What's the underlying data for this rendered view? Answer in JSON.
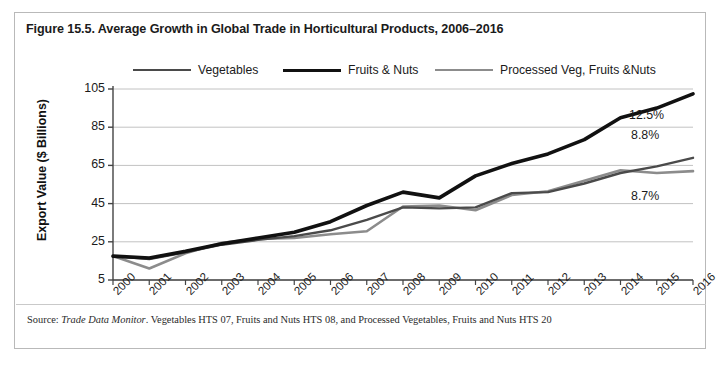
{
  "figure": {
    "title": "Figure 15.5. Average Growth in Global Trade in Horticultural Products, 2006–2016",
    "source_prefix": "Source:",
    "source_italic": "Trade Data Monitor",
    "source_rest": ". Vegetables HTS 07, Fruits and Nuts HTS 08, and Processed Vegetables, Fruits and Nuts HTS 20",
    "border_color": "#b9b9b9"
  },
  "legend": {
    "position": "top",
    "items": [
      {
        "label": "Vegetables",
        "color": "#4a4a4a",
        "width": 2.4
      },
      {
        "label": "Fruits & Nuts",
        "color": "#111111",
        "width": 3.6
      },
      {
        "label": "Processed Veg, Fruits &Nuts",
        "color": "#8c8c8c",
        "width": 2.6
      }
    ]
  },
  "annotations": [
    {
      "text": "12.5%",
      "series": "Fruits & Nuts"
    },
    {
      "text": "8.8%",
      "series": "Vegetables"
    },
    {
      "text": "8.7%",
      "series": "Processed Veg, Fruits &Nuts"
    }
  ],
  "chart_data": {
    "type": "line",
    "title": "Figure 15.5. Average Growth in Global Trade in Horticultural Products, 2006–2016",
    "xlabel": "",
    "ylabel": "Export Value ($ Billions)",
    "x": [
      2000,
      2001,
      2002,
      2003,
      2004,
      2005,
      2006,
      2007,
      2008,
      2009,
      2010,
      2011,
      2012,
      2013,
      2014,
      2015,
      2016
    ],
    "xticklabels": [
      "2000",
      "2001",
      "2002",
      "2003",
      "2004",
      "2005",
      "2006",
      "2007",
      "2008",
      "2009",
      "2010",
      "2011",
      "2012",
      "2013",
      "2014",
      "2015",
      "2016"
    ],
    "yticks": [
      5,
      25,
      45,
      65,
      85,
      105
    ],
    "ylim": [
      5,
      105
    ],
    "grid": true,
    "series": [
      {
        "name": "Vegetables",
        "color": "#4a4a4a",
        "growth_label": "8.8%",
        "values": [
          17.5,
          16.0,
          19.5,
          23.5,
          26.0,
          28.0,
          31.0,
          36.5,
          43.0,
          42.5,
          43.0,
          50.5,
          51.0,
          55.5,
          61.0,
          64.5,
          69.0
        ]
      },
      {
        "name": "Fruits & Nuts",
        "color": "#111111",
        "growth_label": "12.5%",
        "values": [
          17.5,
          16.5,
          20.0,
          24.0,
          27.0,
          30.0,
          35.5,
          44.0,
          51.0,
          48.0,
          59.5,
          66.0,
          71.0,
          78.5,
          90.0,
          95.0,
          102.5
        ]
      },
      {
        "name": "Processed Veg, Fruits &Nuts",
        "color": "#8c8c8c",
        "growth_label": "8.7%",
        "values": [
          17.5,
          11.0,
          19.0,
          24.5,
          26.5,
          27.0,
          29.0,
          30.5,
          43.5,
          44.0,
          41.5,
          49.5,
          51.5,
          57.0,
          62.5,
          61.0,
          62.0
        ]
      }
    ]
  }
}
